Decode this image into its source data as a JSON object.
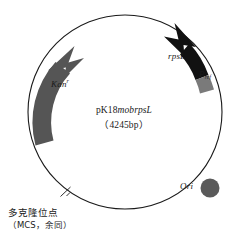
{
  "figure": {
    "kind": "plasmid-map",
    "background_color": "#ffffff",
    "backbone_color": "#1a1a1a"
  },
  "center": {
    "plasmid_name_prefix": "pK18",
    "plasmid_name_italic": "mobrpsL",
    "plasmid_size": "（4245bp）"
  },
  "features": [
    {
      "key": "kan",
      "label": "Kan",
      "superscript": "r",
      "type": "resistance-gene-arrow",
      "color": "#555555",
      "direction": "clockwise"
    },
    {
      "key": "rpsl",
      "label": "rpsL",
      "type": "gene-arrow",
      "color": "#111111",
      "direction": "counter-clockwise"
    },
    {
      "key": "promoter",
      "label": "P",
      "subscript": "ref",
      "type": "promoter-block",
      "color": "#7a7a7a"
    },
    {
      "key": "ori",
      "label": "Ori",
      "type": "origin-marker",
      "color": "#5a5a5a"
    }
  ],
  "mcs": {
    "tick_label_line1": "多克隆位点",
    "tick_label_line2_open": "（",
    "tick_label_line2_latin": "MCS",
    "tick_label_line2_mid": "，余同",
    "tick_label_line2_close": "）",
    "line2_full": "（MCS，余同）"
  }
}
